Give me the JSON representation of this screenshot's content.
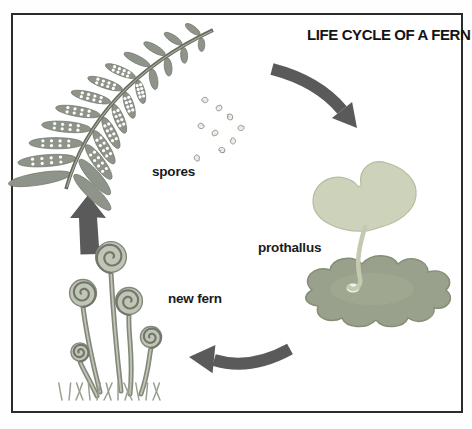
{
  "diagram": {
    "title": "LIFE CYCLE OF A FERN",
    "stages": [
      {
        "id": "spores",
        "label": "spores"
      },
      {
        "id": "prothallus",
        "label": "prothallus"
      },
      {
        "id": "new-fern",
        "label": "new fern"
      }
    ],
    "arrows": [
      {
        "from": "spores",
        "to": "prothallus"
      },
      {
        "from": "prothallus",
        "to": "new-fern"
      },
      {
        "from": "new-fern",
        "to": "spores"
      }
    ],
    "colors": {
      "background": "#ffffff",
      "border": "#2b2b2b",
      "arrow": "#5a5a5a",
      "label_text": "#1b1b1b",
      "frond": "#8f948a",
      "frond_outline": "#6f756a",
      "rachis": "#666c5f",
      "sori": "#ffffff",
      "spore_fill": "#eceee6",
      "spore_outline": "#90938a",
      "prothallus_leaf": "#ccd3ba",
      "prothallus_leaf_outline": "#b4bda0",
      "prothallus_stem": "#c3cab0",
      "prothallus_base": "#99a08b",
      "prothallus_base_outline": "#868e77",
      "fiddlehead_fill": "#c0c5b6",
      "fiddlehead_line": "#70766a",
      "fiddlehead_stem": "#82887b",
      "grass": "#9aa090"
    }
  }
}
